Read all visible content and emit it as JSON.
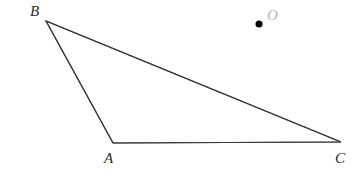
{
  "figure": {
    "kind": "geometry-diagram",
    "width": 361,
    "height": 181,
    "background_color": "#ffffff",
    "stroke_color": "#3a3a3a",
    "stroke_width": 1.2,
    "label_color": "#2b2b2b",
    "point_label_color": "#b0b0b0",
    "point_fill_color": "#000000"
  },
  "triangle": {
    "name": "triangle-ABC",
    "vertices": [
      {
        "id": "B",
        "label": "B",
        "x": 46,
        "y": 21
      },
      {
        "id": "A",
        "label": "A",
        "x": 113,
        "y": 143
      },
      {
        "id": "C",
        "label": "C",
        "x": 341,
        "y": 142
      }
    ],
    "edges": [
      {
        "id": "BA",
        "from": "B",
        "to": "A"
      },
      {
        "id": "AC",
        "from": "A",
        "to": "C"
      },
      {
        "id": "BC",
        "from": "B",
        "to": "C"
      }
    ],
    "path": "M 46 21 L 113 143 L 341 142 Z"
  },
  "point_o": {
    "id": "O",
    "label": "O",
    "x": 259,
    "y": 24,
    "radius": 3.5
  },
  "labels": {
    "B": "B",
    "A": "A",
    "C": "C",
    "O": "O"
  }
}
